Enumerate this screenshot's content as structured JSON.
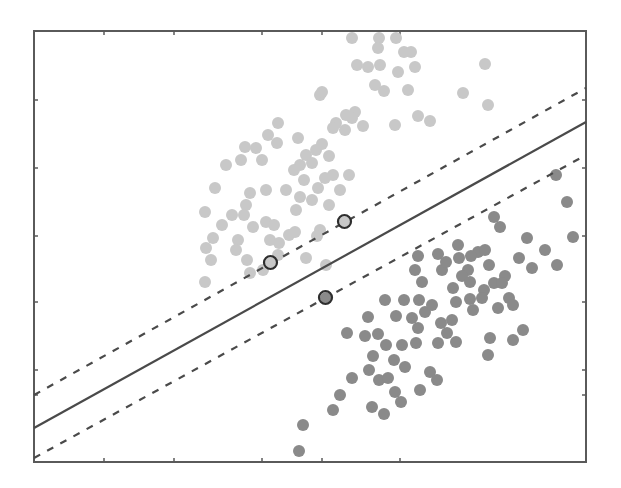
{
  "chart_data": {
    "type": "scatter",
    "title": "",
    "xlabel": "",
    "ylabel": "",
    "grid": false,
    "legend": "none",
    "plot_area_px": {
      "left": 34,
      "top": 31,
      "right": 586,
      "bottom": 462
    },
    "x_ticks_px": [
      34,
      104,
      174,
      262,
      322,
      400,
      586
    ],
    "y_ticks_px": [
      31,
      100,
      168,
      236,
      302,
      370,
      395,
      462
    ],
    "lines": [
      {
        "name": "decision-boundary",
        "style": "solid",
        "x1": 34,
        "y1": 428,
        "x2": 586,
        "y2": 122
      },
      {
        "name": "margin-upper",
        "style": "dashed",
        "x1": 34,
        "y1": 395,
        "x2": 586,
        "y2": 88
      },
      {
        "name": "margin-lower",
        "style": "dashed",
        "x1": 34,
        "y1": 458,
        "x2": 586,
        "y2": 155
      }
    ],
    "series": [
      {
        "name": "class-light",
        "color": "#c8c8c8",
        "points": [
          [
            352,
            38
          ],
          [
            379,
            38
          ],
          [
            396,
            38
          ],
          [
            378,
            48
          ],
          [
            404,
            52
          ],
          [
            411,
            52
          ],
          [
            380,
            65
          ],
          [
            368,
            67
          ],
          [
            357,
            65
          ],
          [
            398,
            72
          ],
          [
            415,
            67
          ],
          [
            375,
            85
          ],
          [
            384,
            91
          ],
          [
            408,
            90
          ],
          [
            463,
            93
          ],
          [
            485,
            64
          ],
          [
            488,
            105
          ],
          [
            320,
            95
          ],
          [
            322,
            92
          ],
          [
            355,
            112
          ],
          [
            352,
            118
          ],
          [
            346,
            115
          ],
          [
            336,
            123
          ],
          [
            333,
            128
          ],
          [
            345,
            130
          ],
          [
            363,
            126
          ],
          [
            395,
            125
          ],
          [
            418,
            116
          ],
          [
            430,
            121
          ],
          [
            278,
            123
          ],
          [
            268,
            135
          ],
          [
            256,
            148
          ],
          [
            277,
            143
          ],
          [
            245,
            147
          ],
          [
            241,
            160
          ],
          [
            226,
            165
          ],
          [
            215,
            188
          ],
          [
            262,
            160
          ],
          [
            298,
            138
          ],
          [
            306,
            155
          ],
          [
            316,
            150
          ],
          [
            322,
            144
          ],
          [
            329,
            156
          ],
          [
            312,
            163
          ],
          [
            300,
            165
          ],
          [
            294,
            170
          ],
          [
            304,
            180
          ],
          [
            325,
            178
          ],
          [
            333,
            175
          ],
          [
            318,
            188
          ],
          [
            312,
            200
          ],
          [
            286,
            190
          ],
          [
            300,
            197
          ],
          [
            340,
            190
          ],
          [
            329,
            205
          ],
          [
            349,
            175
          ],
          [
            266,
            190
          ],
          [
            250,
            193
          ],
          [
            246,
            205
          ],
          [
            232,
            215
          ],
          [
            205,
            212
          ],
          [
            222,
            225
          ],
          [
            213,
            238
          ],
          [
            238,
            240
          ],
          [
            244,
            215
          ],
          [
            253,
            227
          ],
          [
            266,
            222
          ],
          [
            274,
            225
          ],
          [
            289,
            235
          ],
          [
            295,
            232
          ],
          [
            270,
            240
          ],
          [
            279,
            243
          ],
          [
            296,
            210
          ],
          [
            320,
            230
          ],
          [
            317,
            236
          ],
          [
            306,
            258
          ],
          [
            326,
            265
          ],
          [
            236,
            250
          ],
          [
            247,
            260
          ],
          [
            206,
            248
          ],
          [
            211,
            260
          ],
          [
            205,
            282
          ],
          [
            250,
            273
          ],
          [
            263,
            270
          ],
          [
            278,
            255
          ]
        ]
      },
      {
        "name": "class-dark",
        "color": "#8a8a8a",
        "points": [
          [
            556,
            175
          ],
          [
            567,
            202
          ],
          [
            573,
            237
          ],
          [
            557,
            265
          ],
          [
            545,
            250
          ],
          [
            527,
            238
          ],
          [
            519,
            258
          ],
          [
            500,
            227
          ],
          [
            505,
            276
          ],
          [
            532,
            268
          ],
          [
            494,
            217
          ],
          [
            458,
            245
          ],
          [
            478,
            252
          ],
          [
            485,
            250
          ],
          [
            471,
            256
          ],
          [
            459,
            258
          ],
          [
            438,
            254
          ],
          [
            442,
            270
          ],
          [
            418,
            256
          ],
          [
            415,
            270
          ],
          [
            422,
            282
          ],
          [
            446,
            262
          ],
          [
            468,
            270
          ],
          [
            489,
            265
          ],
          [
            494,
            283
          ],
          [
            484,
            290
          ],
          [
            482,
            298
          ],
          [
            502,
            283
          ],
          [
            509,
            298
          ],
          [
            498,
            308
          ],
          [
            513,
            305
          ],
          [
            462,
            276
          ],
          [
            470,
            282
          ],
          [
            453,
            288
          ],
          [
            456,
            302
          ],
          [
            470,
            299
          ],
          [
            473,
            310
          ],
          [
            452,
            320
          ],
          [
            441,
            323
          ],
          [
            447,
            333
          ],
          [
            438,
            343
          ],
          [
            456,
            342
          ],
          [
            425,
            312
          ],
          [
            432,
            305
          ],
          [
            419,
            300
          ],
          [
            404,
            300
          ],
          [
            396,
            316
          ],
          [
            385,
            300
          ],
          [
            368,
            317
          ],
          [
            378,
            334
          ],
          [
            365,
            336
          ],
          [
            386,
            345
          ],
          [
            412,
            318
          ],
          [
            418,
            328
          ],
          [
            416,
            343
          ],
          [
            402,
            345
          ],
          [
            394,
            360
          ],
          [
            373,
            356
          ],
          [
            369,
            370
          ],
          [
            379,
            380
          ],
          [
            388,
            378
          ],
          [
            395,
            392
          ],
          [
            401,
            402
          ],
          [
            384,
            414
          ],
          [
            347,
            333
          ],
          [
            352,
            378
          ],
          [
            372,
            407
          ],
          [
            340,
            395
          ],
          [
            333,
            410
          ],
          [
            303,
            425
          ],
          [
            299,
            451
          ],
          [
            405,
            367
          ],
          [
            430,
            372
          ],
          [
            437,
            380
          ],
          [
            420,
            390
          ],
          [
            488,
            355
          ],
          [
            513,
            340
          ],
          [
            490,
            338
          ],
          [
            523,
            330
          ]
        ]
      }
    ],
    "support_vectors": [
      {
        "class": "class-light",
        "x": 271,
        "y": 263
      },
      {
        "class": "class-light",
        "x": 345,
        "y": 222
      },
      {
        "class": "class-dark",
        "x": 326,
        "y": 298
      }
    ],
    "marker_radius_px": 6
  }
}
